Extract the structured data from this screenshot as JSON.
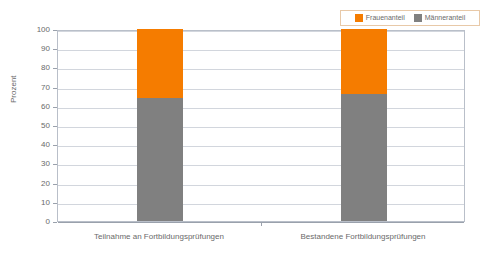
{
  "chart_data": {
    "type": "bar",
    "subtype": "stacked-100",
    "title": "",
    "xlabel": "",
    "ylabel": "Prozent",
    "ylim": [
      0,
      100
    ],
    "ytick_step": 10,
    "yticks": [
      100,
      90,
      80,
      70,
      60,
      50,
      40,
      30,
      20,
      10,
      0
    ],
    "grid": true,
    "legend_position": "top-right",
    "categories": [
      "Teilnahme an Fortbildungsprüfungen",
      "Bestandene Fortbildungsprüfungen"
    ],
    "series": [
      {
        "name": "Männeranteil",
        "color": "#808080",
        "values": [
          64,
          66
        ]
      },
      {
        "name": "Frauenanteil",
        "color": "#F57C00",
        "values": [
          36,
          34
        ]
      }
    ]
  },
  "legend": {
    "entries": [
      {
        "label": "Frauenanteil",
        "color": "#F57C00"
      },
      {
        "label": "Männeranteil",
        "color": "#808080"
      }
    ]
  },
  "axes": {
    "y_title": "Prozent",
    "y_labels": [
      "100",
      "90",
      "80",
      "70",
      "60",
      "50",
      "40",
      "30",
      "20",
      "10",
      "0"
    ],
    "x_labels": [
      "Teilnahme an Fortbildungsprüfungen",
      "Bestandene Fortbildungsprüfungen"
    ]
  }
}
